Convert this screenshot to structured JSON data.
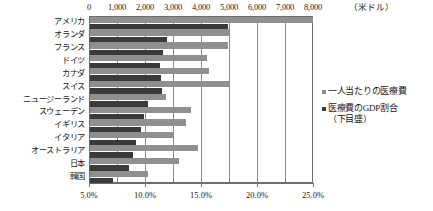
{
  "chart_data": {
    "type": "bar",
    "title": "",
    "subtitle": "",
    "orientation": "horizontal",
    "categories": [
      "アメリカ",
      "オランダ",
      "フランス",
      "ドイツ",
      "カナダ",
      "スイス",
      "ニュージーランド",
      "スウェーデン",
      "イギリス",
      "イタリア",
      "オーストラリア",
      "日本",
      "韓国"
    ],
    "series": [
      {
        "name": "一人当たりの医療費",
        "axis": "top",
        "unit": "米ドル",
        "color": "#8f8f8f",
        "values": [
          8000,
          5000,
          4950,
          4200,
          4300,
          5000,
          2750,
          3650,
          3450,
          3050,
          3900,
          3200,
          2100
        ]
      },
      {
        "name": "医療費のGDP割合（下目盛）",
        "axis": "bottom",
        "unit": "%",
        "color": "#3a3a3a",
        "values": [
          17.4,
          12.0,
          11.6,
          11.3,
          11.4,
          11.5,
          10.3,
          9.9,
          9.6,
          9.2,
          8.9,
          8.6,
          7.1
        ]
      }
    ],
    "top_axis": {
      "label": "（米ドル）",
      "ticks": [
        "0",
        "1,000",
        "2,000",
        "3,000",
        "4,000",
        "5,000",
        "6,000",
        "7,000",
        "8,000"
      ],
      "min": 0,
      "max": 8000,
      "step": 1000
    },
    "bottom_axis": {
      "label": "",
      "ticks": [
        "5.0%",
        "10.0%",
        "15.0%",
        "20.0%",
        "25.0%"
      ],
      "min": 5.0,
      "max": 25.0,
      "step": 5.0
    },
    "legend": {
      "position": "right",
      "entries": [
        {
          "label": "一人当たりの医療費",
          "color": "#8f8f8f"
        },
        {
          "label": "医療費のGDP割合\n（下目盛）",
          "color": "#3a3a3a"
        }
      ]
    },
    "grid": {
      "vertical": true,
      "horizontal": false
    },
    "frame_color": "#6e6e6e"
  }
}
